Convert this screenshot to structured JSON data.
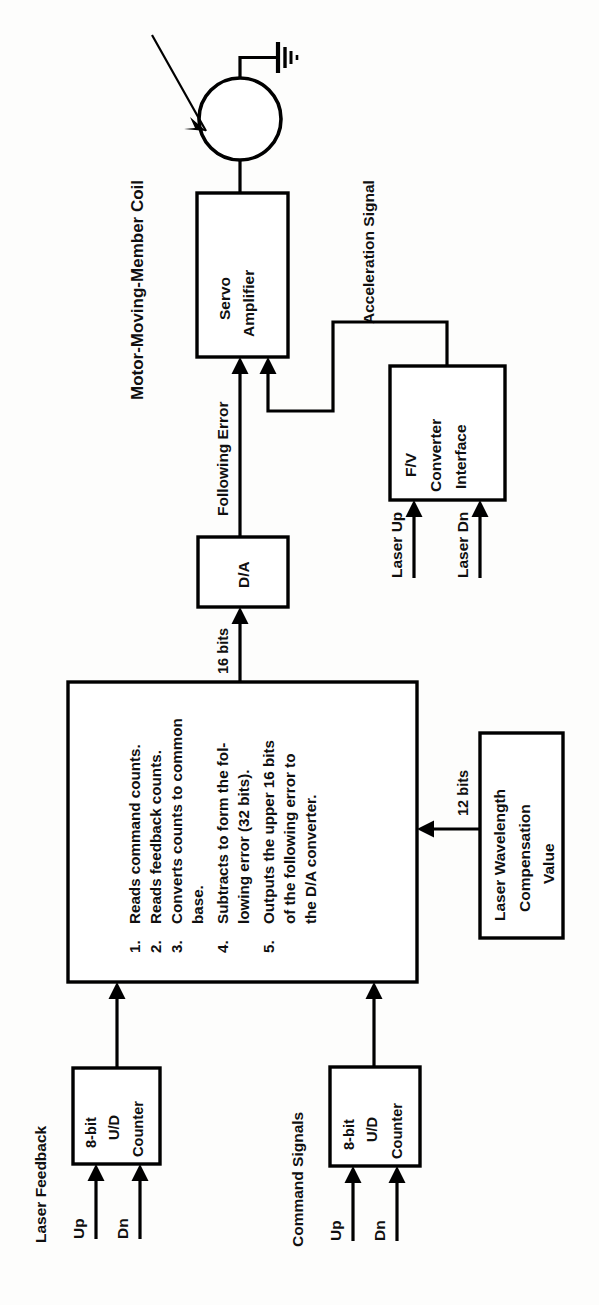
{
  "figure": {
    "kind": "block-diagram",
    "orientation": "rotated-90-ccw"
  },
  "blocks": {
    "servo_amplifier": {
      "line1": "Servo",
      "line2": "Amplifier"
    },
    "da_converter": {
      "label": "D/A"
    },
    "fv_converter": {
      "line1": "F/V",
      "line2": "Converter",
      "line3": "Interface"
    },
    "laser_wavelength": {
      "line1": "Laser Wavelength",
      "line2": "Compensation",
      "line3": "Value"
    },
    "counter_feedback": {
      "line1": "8-bit",
      "line2": "U/D",
      "line3": "Counter"
    },
    "counter_command": {
      "line1": "8-bit",
      "line2": "U/D",
      "line3": "Counter"
    },
    "cpu": {
      "items": [
        {
          "num": "1.",
          "lines": [
            "Reads command counts."
          ]
        },
        {
          "num": "2.",
          "lines": [
            "Reads feedback counts."
          ]
        },
        {
          "num": "3.",
          "lines": [
            "Converts counts to common",
            "base."
          ]
        },
        {
          "num": "4.",
          "lines": [
            "Subtracts to form the fol-",
            "lowing error (32 bits)."
          ]
        },
        {
          "num": "5.",
          "lines": [
            "Outputs the upper 16 bits",
            "of the following error to",
            "the D/A converter."
          ]
        }
      ]
    }
  },
  "labels": {
    "motor_coil": "Motor-Moving-Member Coil",
    "acceleration_signal": "Acceleration Signal",
    "following_error": "Following Error",
    "bits_16": "16 bits",
    "bits_12": "12 bits",
    "laser_up": "Laser Up",
    "laser_dn": "Laser Dn",
    "laser_feedback": "Laser Feedback",
    "command_signals": "Command Signals",
    "up_feedback": "Up",
    "dn_feedback": "Dn",
    "up_command": "Up",
    "dn_command": "Dn"
  },
  "icons": {
    "ground": "ground-symbol",
    "coil": "motor-coil-circle",
    "callout": "callout-arrow"
  },
  "colors": {
    "stroke": "#000000",
    "fill": "#ffffff",
    "background": "#fdfdfc",
    "text": "#101010"
  }
}
